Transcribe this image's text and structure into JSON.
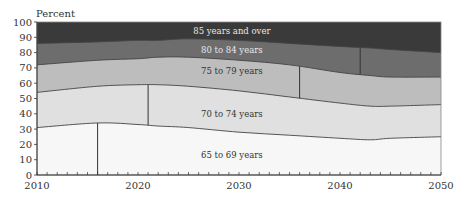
{
  "chart_data": {
    "type": "area",
    "stacked": true,
    "title": "",
    "ylabel": "Percent",
    "xlabel": "",
    "xlim": [
      2010,
      2050
    ],
    "ylim": [
      0,
      100
    ],
    "x_ticks": [
      2010,
      2020,
      2030,
      2040,
      2050
    ],
    "y_ticks": [
      0,
      10,
      20,
      30,
      40,
      50,
      60,
      70,
      80,
      90,
      100
    ],
    "grid": false,
    "legend": "inline labels",
    "x": [
      2010,
      2016,
      2020,
      2022,
      2025,
      2030,
      2035,
      2040,
      2043,
      2045,
      2050
    ],
    "cumulative_boundaries": [
      {
        "name": "65 to 69 years",
        "top": [
          31,
          34,
          33,
          32,
          31,
          28,
          26,
          24,
          23,
          24,
          25
        ]
      },
      {
        "name": "70 to 74 years",
        "top": [
          54,
          58,
          59,
          59,
          58,
          55,
          51,
          47,
          45,
          45,
          46
        ]
      },
      {
        "name": "75 to 79 years",
        "top": [
          72,
          75,
          76,
          77,
          77,
          75,
          72,
          67,
          65,
          64,
          64
        ]
      },
      {
        "name": "80 to 84 years",
        "top": [
          86,
          87,
          88,
          88,
          89,
          88,
          86,
          84,
          83,
          82,
          80
        ]
      },
      {
        "name": "85 years and over",
        "top": [
          100,
          100,
          100,
          100,
          100,
          100,
          100,
          100,
          100,
          100,
          100
        ]
      }
    ],
    "series": [
      {
        "name": "65 to 69 years",
        "color": "#f7f7f7",
        "values": [
          31,
          34,
          33,
          32,
          31,
          28,
          26,
          24,
          23,
          24,
          25
        ]
      },
      {
        "name": "70 to 74 years",
        "color": "#e0e0e0",
        "values": [
          23,
          24,
          26,
          27,
          27,
          27,
          25,
          23,
          22,
          21,
          21
        ]
      },
      {
        "name": "75 to 79 years",
        "color": "#bdbdbd",
        "values": [
          18,
          17,
          17,
          18,
          19,
          20,
          21,
          20,
          20,
          19,
          18
        ]
      },
      {
        "name": "80 to 84 years",
        "color": "#6d6d6d",
        "values": [
          14,
          12,
          12,
          11,
          12,
          13,
          14,
          17,
          18,
          18,
          16
        ]
      },
      {
        "name": "85 years and over",
        "color": "#3a3a3a",
        "values": [
          14,
          13,
          12,
          12,
          11,
          12,
          14,
          16,
          17,
          18,
          20
        ]
      }
    ],
    "marker_lines": [
      {
        "year": 2016,
        "band": "65 to 69 years"
      },
      {
        "year": 2021,
        "band": "70 to 74 years"
      },
      {
        "year": 2036,
        "band": "75 to 79 years"
      },
      {
        "year": 2042,
        "band": "80 to 84 years"
      }
    ],
    "annotations": [
      {
        "text": "85 years and over",
        "x": 2029,
        "y": 94
      },
      {
        "text": "80 to 84 years",
        "x": 2029,
        "y": 82
      },
      {
        "text": "75 to 79 years",
        "x": 2029,
        "y": 68
      },
      {
        "text": "70 to 74 years",
        "x": 2029,
        "y": 40
      },
      {
        "text": "65 to 69 years",
        "x": 2029,
        "y": 13
      }
    ]
  }
}
